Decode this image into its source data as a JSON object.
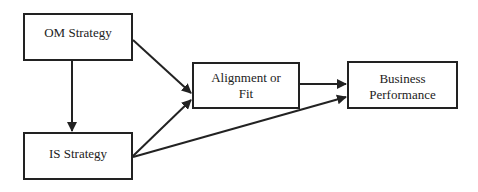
{
  "diagram": {
    "nodes": [
      {
        "id": "om",
        "label": "OM Strategy"
      },
      {
        "id": "is",
        "label": "IS Strategy"
      },
      {
        "id": "fit",
        "label_line1": "Alignment or",
        "label_line2": "Fit"
      },
      {
        "id": "bp",
        "label_line1": "Business",
        "label_line2": "Performance"
      }
    ],
    "edges": [
      {
        "from": "OM Strategy",
        "to": "IS Strategy"
      },
      {
        "from": "OM Strategy",
        "to": "Alignment or Fit"
      },
      {
        "from": "IS Strategy",
        "to": "Alignment or Fit"
      },
      {
        "from": "Alignment or Fit",
        "to": "Business Performance"
      },
      {
        "from": "IS Strategy",
        "to": "Business Performance"
      }
    ],
    "colors": {
      "stroke": "#222222",
      "background": "#ffffff"
    }
  }
}
